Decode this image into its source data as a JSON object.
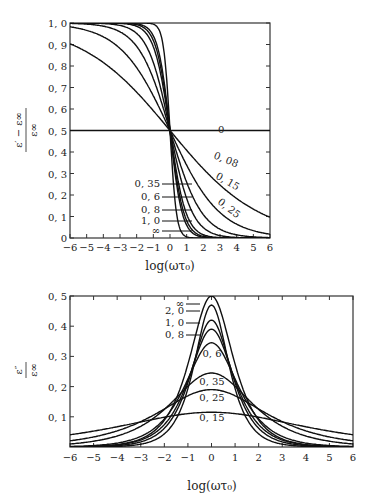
{
  "chart_data": [
    {
      "type": "line",
      "title": "",
      "xlabel": "log(ωτ0)",
      "ylabel": "(ε' − ε∞)/ε∞",
      "xlim": [
        -6,
        6
      ],
      "ylim": [
        0,
        1.0
      ],
      "x_ticks": [
        "-6",
        "-5",
        "-4",
        "-3",
        "-2",
        "-1",
        "0",
        "1",
        "2",
        "3",
        "4",
        "5",
        "6"
      ],
      "y_ticks": [
        "0",
        "0.1",
        "0.2",
        "0.3",
        "0.4",
        "0.5",
        "0.6",
        "0.7",
        "0.8",
        "0.9",
        "1.0"
      ],
      "grid": false,
      "series": [
        {
          "name": "0",
          "beta": 0.0
        },
        {
          "name": "0.08",
          "beta": 0.16
        },
        {
          "name": "0.15",
          "beta": 0.28
        },
        {
          "name": "0.25",
          "beta": 0.42
        },
        {
          "name": "0.35",
          "beta": 0.56
        },
        {
          "name": "0.6",
          "beta": 0.72
        },
        {
          "name": "0.8",
          "beta": 0.8
        },
        {
          "name": "1.0",
          "beta": 0.87
        },
        {
          "name": "∞",
          "beta": 1.0
        }
      ],
      "annotations": {
        "center_point": [
          0,
          0.5
        ]
      }
    },
    {
      "type": "line",
      "title": "",
      "xlabel": "log(ωτ0)",
      "ylabel": "ε''/ε∞",
      "xlim": [
        -6,
        6
      ],
      "ylim": [
        0,
        0.5
      ],
      "x_ticks": [
        "-6",
        "-5",
        "-4",
        "-3",
        "-2",
        "-1",
        "0",
        "1",
        "2",
        "3",
        "4",
        "5",
        "6"
      ],
      "y_ticks": [
        "0.1",
        "0.2",
        "0.3",
        "0.4",
        "0.5"
      ],
      "grid": false,
      "series": [
        {
          "name": "∞",
          "peak": 0.5
        },
        {
          "name": "2.0",
          "peak": 0.47
        },
        {
          "name": "1.0",
          "peak": 0.42
        },
        {
          "name": "0.8",
          "peak": 0.39
        },
        {
          "name": "0.6",
          "peak": 0.345
        },
        {
          "name": "0.35",
          "peak": 0.245
        },
        {
          "name": "0.25",
          "peak": 0.19
        },
        {
          "name": "0.15",
          "peak": 0.115
        }
      ]
    }
  ],
  "labels": {
    "top_xlabel": "log(ωτ₀)",
    "bottom_xlabel": "log(ωτ₀)",
    "top_ylabel_num": "ε′ − ε∞",
    "top_ylabel_den": "ε∞",
    "bottom_ylabel_num": "ε″",
    "bottom_ylabel_den": "ε∞"
  }
}
